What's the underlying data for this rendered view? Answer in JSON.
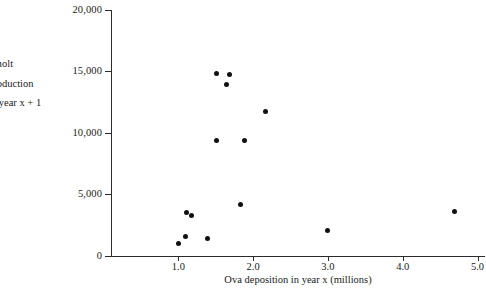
{
  "chart_data": {
    "type": "scatter",
    "title": "",
    "xlabel": "Ova deposition in year  x  (millions)",
    "ylabel_lines": [
      "Smolt",
      "production",
      "in year x + 1"
    ],
    "xlim": [
      0.0,
      5.0
    ],
    "ylim": [
      0,
      20000
    ],
    "grid": false,
    "legend": null,
    "xticks": [
      {
        "value": 1.0,
        "label": "1.0"
      },
      {
        "value": 2.0,
        "label": "2.0"
      },
      {
        "value": 3.0,
        "label": "3.0"
      },
      {
        "value": 4.0,
        "label": "4.0"
      },
      {
        "value": 5.0,
        "label": "5.0"
      }
    ],
    "yticks": [
      {
        "value": 0,
        "label": "0"
      },
      {
        "value": 5000,
        "label": "5,000"
      },
      {
        "value": 10000,
        "label": "10,000"
      },
      {
        "value": 15000,
        "label": "15,000"
      },
      {
        "value": 20000,
        "label": "20,000"
      }
    ],
    "marker": {
      "shape": "circle",
      "color": "#111111",
      "size_px": 5
    },
    "points": [
      {
        "x": 1.0,
        "y": 1050
      },
      {
        "x": 1.09,
        "y": 1600
      },
      {
        "x": 1.11,
        "y": 3500
      },
      {
        "x": 1.17,
        "y": 3250
      },
      {
        "x": 1.39,
        "y": 1450
      },
      {
        "x": 1.51,
        "y": 14800
      },
      {
        "x": 1.51,
        "y": 9350
      },
      {
        "x": 1.65,
        "y": 13900
      },
      {
        "x": 1.68,
        "y": 14700
      },
      {
        "x": 1.83,
        "y": 4150
      },
      {
        "x": 1.89,
        "y": 9350
      },
      {
        "x": 2.16,
        "y": 11700
      },
      {
        "x": 3.0,
        "y": 2050
      },
      {
        "x": 4.69,
        "y": 3650
      }
    ]
  }
}
